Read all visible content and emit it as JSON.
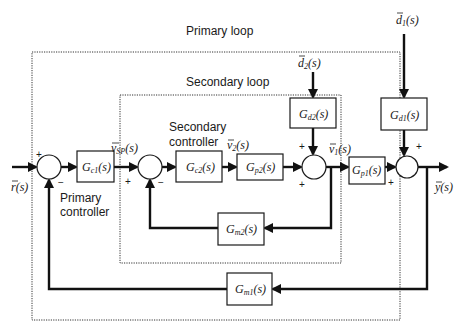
{
  "diagram": {
    "type": "cascade-control-block-diagram",
    "regions": {
      "primary_loop_label": "Primary loop",
      "secondary_loop_label": "Secondary loop",
      "primary_controller_label_line1": "Primary",
      "primary_controller_label_line2": "controller",
      "secondary_controller_label_line1": "Secondary",
      "secondary_controller_label_line2": "controller"
    },
    "blocks": {
      "gc1": {
        "main": "G",
        "sub": "c1",
        "tail": "(s)"
      },
      "gc2": {
        "main": "G",
        "sub": "c2",
        "tail": "(s)"
      },
      "gp2": {
        "main": "G",
        "sub": "p2",
        "tail": "(s)"
      },
      "gp1": {
        "main": "G",
        "sub": "p1",
        "tail": "(s)"
      },
      "gd2": {
        "main": "G",
        "sub": "d2",
        "tail": "(s)"
      },
      "gd1": {
        "main": "G",
        "sub": "d1",
        "tail": "(s)"
      },
      "gm2": {
        "main": "G",
        "sub": "m2",
        "tail": "(s)"
      },
      "gm1": {
        "main": "G",
        "sub": "m1",
        "tail": "(s)"
      }
    },
    "signals": {
      "r": {
        "main": "r",
        "tail": "(s)"
      },
      "vsp": {
        "main": "v",
        "sub": "SP",
        "tail": "(s)"
      },
      "v2": {
        "main": "v",
        "sub": "2",
        "tail": "(s)"
      },
      "v1": {
        "main": "v",
        "sub": "1",
        "tail": "(s)"
      },
      "y": {
        "main": "y",
        "tail": "(s)"
      },
      "d1": {
        "main": "d",
        "sub": "1",
        "tail": "(s)"
      },
      "d2": {
        "main": "d",
        "sub": "2",
        "tail": "(s)"
      }
    },
    "signs": {
      "plus": "+",
      "minus": "−"
    },
    "connections": [
      "r -> sum1(+)",
      "sum1 -> Gc1 -> vSP",
      "vSP -> sum2(+)",
      "sum2 -> Gc2 -> v2 -> Gp2 -> sum3(+)",
      "d2 -> Gd2 -> sum3(+)",
      "sum3 -> v1 -> Gp1 -> sum4(+)",
      "d1 -> Gd1 -> sum4(+)",
      "sum4 -> y",
      "v1 -> Gm2 -> sum2(-)",
      "y -> Gm1 -> sum1(-)"
    ]
  }
}
